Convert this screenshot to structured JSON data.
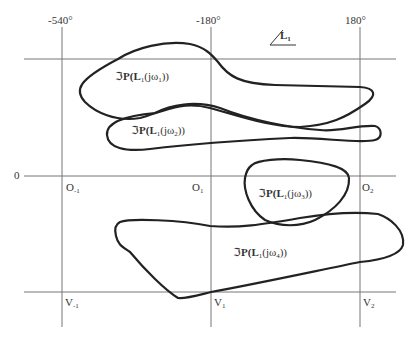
{
  "axes": {
    "top_tick_labels": [
      {
        "text": "-540°",
        "x": 48,
        "y": 14
      },
      {
        "text": "-180°",
        "x": 196,
        "y": 14
      },
      {
        "text": "180°",
        "x": 345,
        "y": 14
      }
    ],
    "phase_label": "L",
    "phase_label_sub": "1",
    "zero_label": "0",
    "grid_x": [
      62,
      211,
      360
    ],
    "grid_y": [
      59,
      176,
      292
    ],
    "line_color": "#777777"
  },
  "points": {
    "O": [
      {
        "main": "O",
        "sub": "-1"
      },
      {
        "main": "O",
        "sub": "1"
      },
      {
        "main": "O",
        "sub": "2"
      }
    ],
    "V": [
      {
        "main": "V",
        "sub": "-1"
      },
      {
        "main": "V",
        "sub": "1"
      },
      {
        "main": "V",
        "sub": "2"
      }
    ]
  },
  "templates": [
    {
      "prefix": "ℑ",
      "p": "P(L",
      "l_sub": "1",
      "mid": "(jω",
      "w_sub": "1",
      "end": "))"
    },
    {
      "prefix": "ℑ",
      "p": "P(L",
      "l_sub": "1",
      "mid": "(jω",
      "w_sub": "2",
      "end": "))"
    },
    {
      "prefix": "ℑ",
      "p": "P(L",
      "l_sub": "1",
      "mid": "(jω",
      "w_sub": "3",
      "end": "))"
    },
    {
      "prefix": "ℑ",
      "p": "P(L",
      "l_sub": "1",
      "mid": "(jω",
      "w_sub": "4",
      "end": "))"
    }
  ],
  "curve_color": "#222222"
}
